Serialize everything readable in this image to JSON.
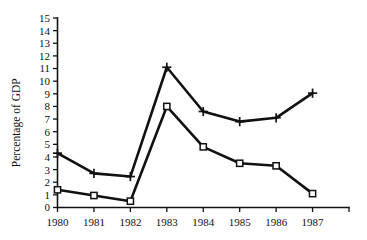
{
  "chart_data": {
    "type": "line",
    "title": "",
    "xlabel": "",
    "ylabel": "Percentage of GDP",
    "x": [
      1980,
      1981,
      1982,
      1983,
      1984,
      1985,
      1986,
      1987
    ],
    "xtick_labels": [
      "1980",
      "1981",
      "1982",
      "1983",
      "1984",
      "1985",
      "1986",
      "1987"
    ],
    "ytick_labels": [
      "0",
      "1",
      "2",
      "3",
      "4",
      "5",
      "6",
      "7",
      "8",
      "9",
      "10",
      "11",
      "12",
      "13",
      "14",
      "15"
    ],
    "ylim": [
      0,
      15
    ],
    "xlim": [
      1980,
      1988
    ],
    "grid": false,
    "legend": "none",
    "series": [
      {
        "name": "upper-series",
        "marker": "plus",
        "values": [
          4.3,
          2.7,
          2.45,
          11.1,
          7.6,
          6.8,
          7.1,
          9.05
        ]
      },
      {
        "name": "lower-series",
        "marker": "open-square",
        "values": [
          1.4,
          0.95,
          0.5,
          8.0,
          4.8,
          3.5,
          3.3,
          1.1
        ]
      }
    ],
    "colors": {
      "line": "#111111",
      "axis": "#111111",
      "background": "#ffffff"
    }
  }
}
